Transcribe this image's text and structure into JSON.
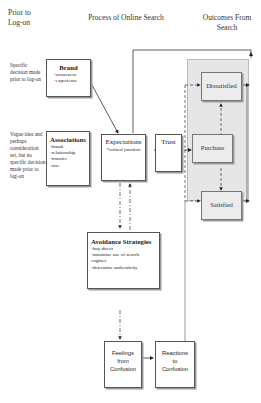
{
  "headers": {
    "prior": "Prior to Log-on",
    "process": "Process of Online Search",
    "outcomes": "Outcomes From Search"
  },
  "side_notes": {
    "specific": "Specific decision made prior to log-on",
    "vague": "Vague idea and perhaps consideration set, but no specific decision made prior to log-on"
  },
  "brand": {
    "title": "Brand",
    "items": [
      "-awareness",
      "-experience"
    ]
  },
  "associations": {
    "title": "Associations",
    "items": [
      "-brand",
      "-relationship",
      "-transfer",
      "-size"
    ]
  },
  "expectations": {
    "title": "Expectations",
    "note": "*critical junction"
  },
  "trust": {
    "title": "Trust"
  },
  "outcomes": {
    "dissatisfied": "Dissatisfied",
    "purchase": "Purchase",
    "satisfied": "Satisfied"
  },
  "avoidance": {
    "title": "Avoidance Strategies",
    "items": [
      "-buy direct",
      "-minimize use of search engines",
      "-determine authenticity"
    ]
  },
  "feelings": {
    "title": "Feelings from Confusion"
  },
  "reactions": {
    "title": "Reactions to Confusion"
  },
  "colors": {
    "outcome_panel": "#e4e4e4",
    "box_border": "#555555"
  }
}
